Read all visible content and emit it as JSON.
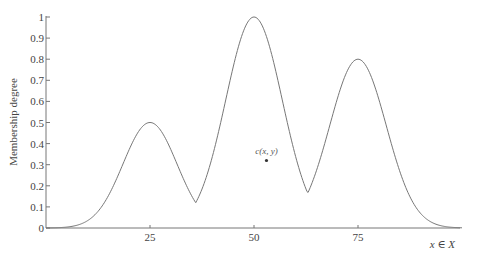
{
  "chart_data": {
    "type": "line",
    "title": "",
    "xlabel": "x ∈ X",
    "ylabel": "Membership degree",
    "xlim": [
      0,
      100
    ],
    "ylim": [
      0,
      1
    ],
    "grid": false,
    "legend": null,
    "x_ticks": [
      25,
      50,
      75
    ],
    "x_tick_labels": [
      "25",
      "50",
      "75"
    ],
    "y_ticks": [
      0,
      0.1,
      0.2,
      0.3,
      0.4,
      0.5,
      0.6,
      0.7,
      0.8,
      0.9,
      1
    ],
    "y_tick_labels": [
      "0",
      "0.1",
      "0.2",
      "0.3",
      "0.4",
      "0.5",
      "0.6",
      "0.7",
      "0.8",
      "0.9",
      "1"
    ],
    "series": [
      {
        "name": "membership function",
        "description": "Max of three Gaussian bumps centered at 25 (0.5), 50 (1.0), 75 (0.8)",
        "peaks": [
          {
            "x": 25,
            "y": 0.5
          },
          {
            "x": 50,
            "y": 1.0
          },
          {
            "x": 75,
            "y": 0.8
          }
        ],
        "valleys": [
          {
            "x": 36.5,
            "y": 0.21
          },
          {
            "x": 63.5,
            "y": 0.27
          }
        ],
        "x": [
          0,
          5,
          10,
          15,
          20,
          25,
          30,
          35,
          36.5,
          40,
          45,
          50,
          55,
          60,
          63.5,
          65,
          70,
          75,
          80,
          85,
          90,
          95,
          100
        ],
        "values": [
          0.01,
          0.04,
          0.12,
          0.26,
          0.42,
          0.5,
          0.42,
          0.26,
          0.21,
          0.37,
          0.78,
          1.0,
          0.78,
          0.37,
          0.27,
          0.3,
          0.63,
          0.8,
          0.63,
          0.3,
          0.09,
          0.02,
          0.0
        ]
      }
    ],
    "annotations": [
      {
        "text": "c(x, y)",
        "x": 53,
        "y": 0.32,
        "marker": "dot"
      }
    ]
  },
  "axes": {
    "xlabel": "x ∈ X",
    "ylabel": "Membership degree"
  },
  "annotation": {
    "label": "c(x, y)"
  },
  "colors": {
    "curve": "#777777",
    "axis": "#777777",
    "text": "#444444",
    "background": "#ffffff"
  }
}
